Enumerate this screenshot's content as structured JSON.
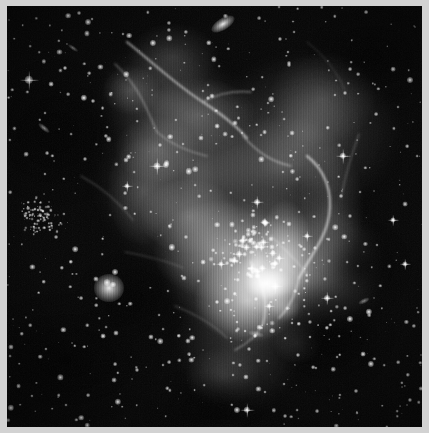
{
  "image": {
    "title": "Star-forming nebula with embedded open star cluster",
    "kind": "astronomical-photograph",
    "color_mode": "grayscale",
    "width_px": 429,
    "height_px": 433,
    "border": {
      "color": "#d2d2d2",
      "thickness_px": 6,
      "visible": true
    },
    "plate": {
      "background_color": "#050505",
      "left_px": 7,
      "top_px": 6,
      "width_px": 415,
      "height_px": 421
    },
    "palette": {
      "sky": "#050505",
      "nebula_dim": "#4a4a4a",
      "nebula_mid": "#8a8a8a",
      "nebula_bright": "#d8d8d8",
      "star_core": "#ffffff",
      "frame": "#d2d2d2"
    },
    "features": [
      {
        "name": "main-nebula",
        "description": "Large diffuse emission nebula occupying the upper-right and central portion of the frame, brightest toward lower-centre-right",
        "bbox_pct": [
          22,
          4,
          92,
          86
        ]
      },
      {
        "name": "central-star-cluster",
        "description": "Compact group of bright young stars at the heart of the nebula",
        "center_pct": [
          58,
          57
        ]
      },
      {
        "name": "left-globular-cluster",
        "description": "Small tight knot of faint stars on the left edge",
        "center_pct": [
          9,
          51
        ]
      },
      {
        "name": "bright-spiked-star-left",
        "description": "Bright foreground star with four-point diffraction spikes near the left border",
        "center_pct": [
          5,
          17
        ]
      },
      {
        "name": "bright-fuzzy-star-lower-left",
        "description": "Bright bloated star below centre-left",
        "center_pct": [
          25,
          67
        ]
      },
      {
        "name": "edge-on-galaxy-top",
        "description": "Small elongated background galaxy near the top edge",
        "center_pct": [
          52,
          4
        ]
      },
      {
        "name": "dust-ridge-right",
        "description": "Sharp filamentary dust ridge marking the right-hand boundary of the nebula",
        "center_pct": [
          75,
          45
        ]
      },
      {
        "name": "dark-bay-lower-right",
        "description": "Dark dust bay cutting into the nebula at lower right",
        "center_pct": [
          72,
          76
        ]
      }
    ],
    "star_count_visible": 420,
    "artifacts": [
      "vertical-ccd-striping",
      "diffraction-spikes",
      "image-noise-grain"
    ]
  }
}
